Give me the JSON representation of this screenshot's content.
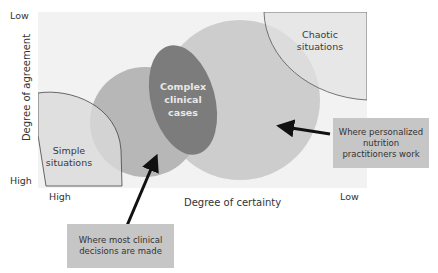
{
  "axes": {
    "y_title": "Degree of agreement",
    "y_top": "Low",
    "y_bottom": "High",
    "x_title": "Degree of certainty",
    "x_left": "High",
    "x_right": "Low"
  },
  "regions": {
    "simple": "Simple situations",
    "simple_line1": "Simple",
    "simple_line2": "situations",
    "chaotic_line1": "Chaotic",
    "chaotic_line2": "situations",
    "complex_line1": "Complex",
    "complex_line2": "clinical",
    "complex_line3": "cases"
  },
  "callouts": {
    "personalized": {
      "line1": "Where personalized",
      "line2": "nutrition",
      "line3": "practitioners work"
    },
    "clinical": {
      "line1": "Where most clinical",
      "line2": "decisions are made"
    }
  },
  "colors": {
    "plot_bg": "#f2f2f2",
    "simple_fill": "#dcdcdc",
    "mid_circle": "#b9b9b9",
    "large_circle": "#cdcdcd",
    "complex_ellipse": "#7a7a7a",
    "callout_bg": "#c6c6c6",
    "arrow": "#111111"
  }
}
